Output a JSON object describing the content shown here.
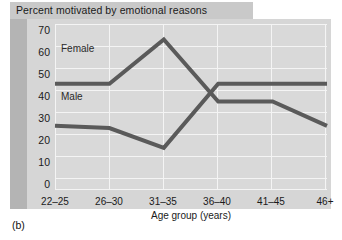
{
  "figure": {
    "caption": "(b)",
    "title": "Percent motivated by emotional reasons"
  },
  "colors": {
    "line": "#5a5a5a",
    "plot_background": "#d9d9d9",
    "panel_background": "#d6d6d6",
    "gutter": "#b4b4b4",
    "title_band": "#c9c9c9",
    "gridline": "#f4f4f4",
    "text": "#1a1a1a"
  },
  "axes": {
    "y_ticks": [
      "0",
      "10",
      "20",
      "30",
      "40",
      "50",
      "60",
      "70"
    ],
    "x_ticks": [
      "22–25",
      "26–30",
      "31–35",
      "36–40",
      "41–45",
      "46+"
    ],
    "x_title": "Age group (years)",
    "y_title": ""
  },
  "series_labels": {
    "female": "Female",
    "male": "Male"
  },
  "chart_data": {
    "type": "line",
    "title": "Percent motivated by emotional reasons",
    "xlabel": "Age group (years)",
    "ylabel": "",
    "categories": [
      "22–25",
      "26–30",
      "31–35",
      "36–40",
      "41–45",
      "46+"
    ],
    "ylim": [
      0,
      75
    ],
    "yticks": [
      0,
      10,
      20,
      30,
      40,
      50,
      60,
      70
    ],
    "grid": true,
    "legend": "inline-labels",
    "series": [
      {
        "name": "Female",
        "values": [
          48,
          48,
          68,
          40,
          40,
          29
        ]
      },
      {
        "name": "Male",
        "values": [
          29,
          28,
          19,
          48,
          48,
          48
        ]
      }
    ]
  }
}
